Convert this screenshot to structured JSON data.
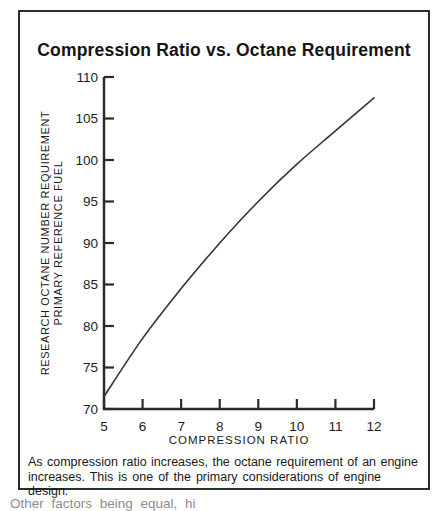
{
  "figure": {
    "title": "Compression Ratio vs. Octane Requirement",
    "caption_line1": "As compression ratio increases, the octane requirement of an engine",
    "caption_line2": "increases.  This is one of the primary considerations of engine design.",
    "cropped_text_below_box": "Other factors being equal, hi",
    "ink_color": "#1c1c1c"
  },
  "chart_data": {
    "type": "line",
    "title": "Compression Ratio vs. Octane Requirement",
    "xlabel": "COMPRESSION RATIO",
    "ylabel_line1": "RESEARCH OCTANE NUMBER REQUIREMENT",
    "ylabel_line2": "PRIMARY REFERENCE FUEL",
    "series": [
      {
        "name": "octane requirement vs compression ratio",
        "x": [
          5,
          6,
          7,
          8,
          9,
          10,
          11,
          12
        ],
        "values": [
          71.5,
          78.5,
          84.5,
          90,
          95,
          99.5,
          103.5,
          107.5
        ]
      }
    ],
    "xticks": [
      5,
      6,
      7,
      8,
      9,
      10,
      11,
      12
    ],
    "yticks": [
      70,
      75,
      80,
      85,
      90,
      95,
      100,
      105,
      110
    ],
    "xlim": [
      5,
      12
    ],
    "ylim": [
      70,
      110
    ],
    "grid": false,
    "legend": null,
    "line_color": "#333333"
  }
}
